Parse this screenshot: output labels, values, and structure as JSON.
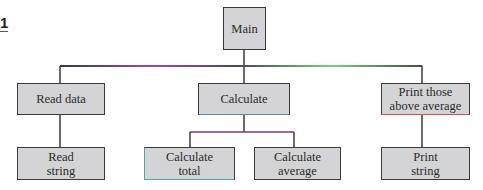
{
  "figure": {
    "number": "1"
  },
  "diagram": {
    "type": "hierarchy-chart",
    "root": {
      "id": "main",
      "label": "Main"
    },
    "level2": [
      {
        "id": "read-data",
        "label": "Read data"
      },
      {
        "id": "calculate",
        "label": "Calculate"
      },
      {
        "id": "print-above-average",
        "label_line1": "Print those",
        "label_line2": "above average"
      }
    ],
    "level3": [
      {
        "id": "read-string",
        "parent": "read-data",
        "label_line1": "Read",
        "label_line2": "string"
      },
      {
        "id": "calculate-total",
        "parent": "calculate",
        "label_line1": "Calculate",
        "label_line2": "total"
      },
      {
        "id": "calculate-average",
        "parent": "calculate",
        "label_line1": "Calculate",
        "label_line2": "average"
      },
      {
        "id": "print-string",
        "parent": "print-above-average",
        "label_line1": "Print",
        "label_line2": "string"
      }
    ],
    "colors": {
      "box_fill": "#d4d4d6",
      "box_border": "#3a3a3a",
      "line": "#3a3a3a",
      "accent_left_line": "#b05ab8",
      "accent_right_line": "#6fd86f",
      "accent_underline": "#d84a5a"
    }
  }
}
